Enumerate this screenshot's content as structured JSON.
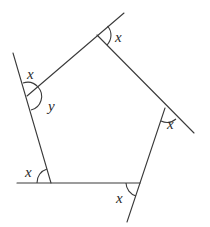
{
  "diagram": {
    "type": "pentagon with extended sides (exterior angles)",
    "vertices": {
      "top": [
        97,
        35
      ],
      "right": [
        165,
        108
      ],
      "bottom_right": [
        140,
        183
      ],
      "bottom_left": [
        51,
        182
      ],
      "left": [
        27,
        96
      ]
    },
    "labels": {
      "top_exterior": "x",
      "right_exterior": "x",
      "left_exterior": "x",
      "left_interior": "y",
      "bottom_left_exterior": "x",
      "bottom_right_exterior": "x"
    },
    "colors": {
      "stroke": "#3a3a3a",
      "text": "#2a2a2a",
      "background": "#ffffff"
    }
  }
}
